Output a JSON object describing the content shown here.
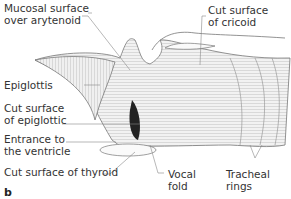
{
  "figure": {
    "panel_label": "b",
    "labels": {
      "mucosal": "Mucosal surface\nover arytenoid",
      "cricoid": "Cut surface\nof cricoid",
      "epiglottis": "Epiglottis",
      "cut_epiglottic": "Cut surface of\nof epiglottic",
      "ventricle": "Entrance to\nthe ventricle",
      "thyroid": "Cut surface of thyroid",
      "vocal": "Vocal\nfold",
      "tracheal": "Tracheal\nrings"
    },
    "colors": {
      "line": "#888888",
      "dark": "#222222",
      "fill": "#e6e6e6"
    }
  }
}
